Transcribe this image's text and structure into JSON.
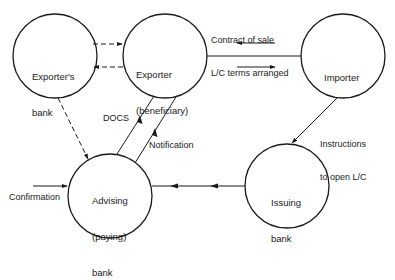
{
  "diagram": {
    "nodes": [
      {
        "id": "exporters-bank",
        "label_line1": "Exporter's",
        "label_line2": "bank"
      },
      {
        "id": "exporter",
        "label_line1": "Exporter",
        "label_line2": "(beneficiary)"
      },
      {
        "id": "importer",
        "label_line1": "Importer",
        "label_line2": ""
      },
      {
        "id": "advising-bank",
        "label_line1": "Advising",
        "label_line2": "(paying)",
        "label_line3": "bank"
      },
      {
        "id": "issuing-bank",
        "label_line1": "Issuing",
        "label_line2": "bank"
      }
    ],
    "edge_labels": {
      "contract_line1": "Contract of sale",
      "contract_line2": "L/C terms arranged",
      "instructions_line1": "Instructions",
      "instructions_line2": "to open L/C",
      "docs": "DOCS",
      "notification": "Notification",
      "confirmation": "Confirmation"
    },
    "edges": [
      {
        "from": "exporters-bank",
        "to": "exporter",
        "style": "dashed"
      },
      {
        "from": "exporter",
        "to": "exporters-bank",
        "style": "dashed"
      },
      {
        "from": "exporter",
        "to": "importer",
        "style": "solid",
        "bidirectional": true
      },
      {
        "from": "importer",
        "to": "issuing-bank",
        "style": "solid"
      },
      {
        "from": "issuing-bank",
        "to": "advising-bank",
        "style": "solid"
      },
      {
        "from": "advising-bank",
        "to": "exporter",
        "style": "solid",
        "label": "DOCS"
      },
      {
        "from": "advising-bank",
        "to": "exporter",
        "style": "solid",
        "label": "Notification"
      },
      {
        "from": "exporters-bank",
        "to": "advising-bank",
        "style": "dashed"
      },
      {
        "from": "external",
        "to": "advising-bank",
        "style": "solid",
        "label": "Confirmation"
      }
    ],
    "colors": {
      "stroke": "#1a1a1a",
      "background": "#ffffff"
    }
  }
}
